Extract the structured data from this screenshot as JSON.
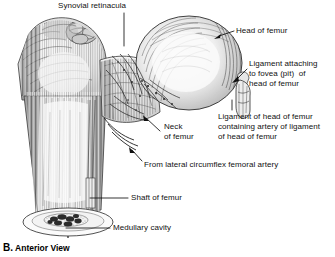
{
  "figure": {
    "caption_letter": "B.",
    "caption_text": "Anterior View",
    "background_color": "#ffffff",
    "ink_color": "#1a1a1a"
  },
  "labels": {
    "synovial_retinacula": "Synovial retinacula",
    "head_of_femur": "Head of femur",
    "ligament_fovea_l1": "Ligament attaching",
    "ligament_fovea_l2": "to fovea (pit)  of",
    "ligament_fovea_l3": "head of femur",
    "ligament_head_l1": "Ligament of head of femur",
    "ligament_head_l2": "containing artery of ligament",
    "ligament_head_l3": "of head of femur",
    "neck_l1": "Neck",
    "neck_l2": "of femur",
    "lateral_circumflex": "From lateral circumflex femoral artery",
    "shaft_of_femur": "Shaft of femur",
    "medullary_cavity": "Medullary cavity"
  }
}
